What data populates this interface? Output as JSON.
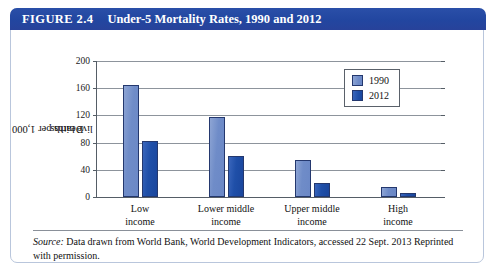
{
  "figure": {
    "number_label": "FIGURE 2.4",
    "title": "Under-5 Mortality Rates, 1990 and 2012"
  },
  "source": {
    "label": "Source:",
    "text": " Data drawn from World Bank, World Development Indicators, accessed 22 Sept. 2013 Reprinted with permission."
  },
  "colors": {
    "header_blue": "#2246a0",
    "series_1990": "#6f8cc8",
    "series_2012": "#1f4fa8",
    "border": "#b9c6dc",
    "gridline": "#8d949c"
  },
  "chart_data": {
    "type": "bar",
    "title": "Under-5 Mortality Rates, 1990 and 2012",
    "xlabel": "",
    "ylabel": "Deaths per 1,000 live births",
    "ylabel_line1": "Deaths per 1,000",
    "ylabel_line2": "live births",
    "categories": [
      "Low income",
      "Lower middle income",
      "Upper middle income",
      "High income"
    ],
    "category_lines": [
      [
        "Low",
        "income"
      ],
      [
        "Lower middle",
        "income"
      ],
      [
        "Upper middle",
        "income"
      ],
      [
        "High",
        "income"
      ]
    ],
    "series": [
      {
        "name": "1990",
        "values": [
          165,
          118,
          54,
          14
        ]
      },
      {
        "name": "2012",
        "values": [
          82,
          61,
          20,
          6
        ]
      }
    ],
    "ylim": [
      0,
      200
    ],
    "yticks": [
      0,
      40,
      80,
      120,
      160,
      200
    ],
    "ytick_labels": [
      "0",
      "40",
      "80",
      "120",
      "160",
      "200"
    ],
    "grid": true,
    "legend_position": "top-right",
    "legend_entries": [
      "1990",
      "2012"
    ]
  }
}
